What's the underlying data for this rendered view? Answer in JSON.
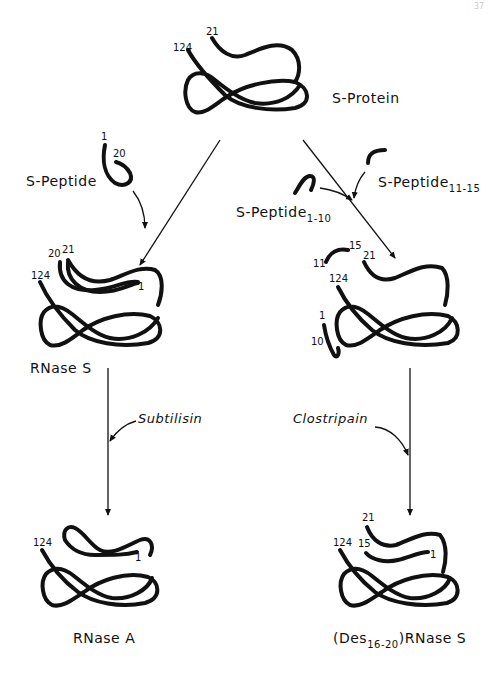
{
  "page_number": "37",
  "molecules": {
    "s_protein": {
      "label": "S-Protein",
      "residue_labels": [
        "21",
        "124"
      ]
    },
    "s_peptide": {
      "label": "S-Peptide",
      "residue_labels": [
        "1",
        "20"
      ]
    },
    "s_peptide_1_10": {
      "label": "S-Peptide",
      "subscript": "1-10"
    },
    "s_peptide_11_15": {
      "label": "S-Peptide",
      "subscript": "11-15"
    },
    "rnase_s": {
      "label": "RNase S",
      "residue_labels": [
        "20",
        "21",
        "124",
        "1"
      ]
    },
    "rnase_s_mix": {
      "residue_labels": [
        "11",
        "15",
        "21",
        "124",
        "1",
        "10"
      ]
    },
    "rnase_a": {
      "label": "RNase A",
      "residue_labels": [
        "124",
        "1"
      ]
    },
    "des_rnase_s": {
      "label_prefix": "(Des",
      "subscript": "16-20",
      "label_suffix": ")RNase S",
      "residue_labels": [
        "21",
        "124",
        "15",
        "1"
      ]
    }
  },
  "enzymes": {
    "left": "Subtilisin",
    "right": "Clostripain"
  },
  "colors": {
    "ink": "#111111",
    "background": "#ffffff"
  }
}
